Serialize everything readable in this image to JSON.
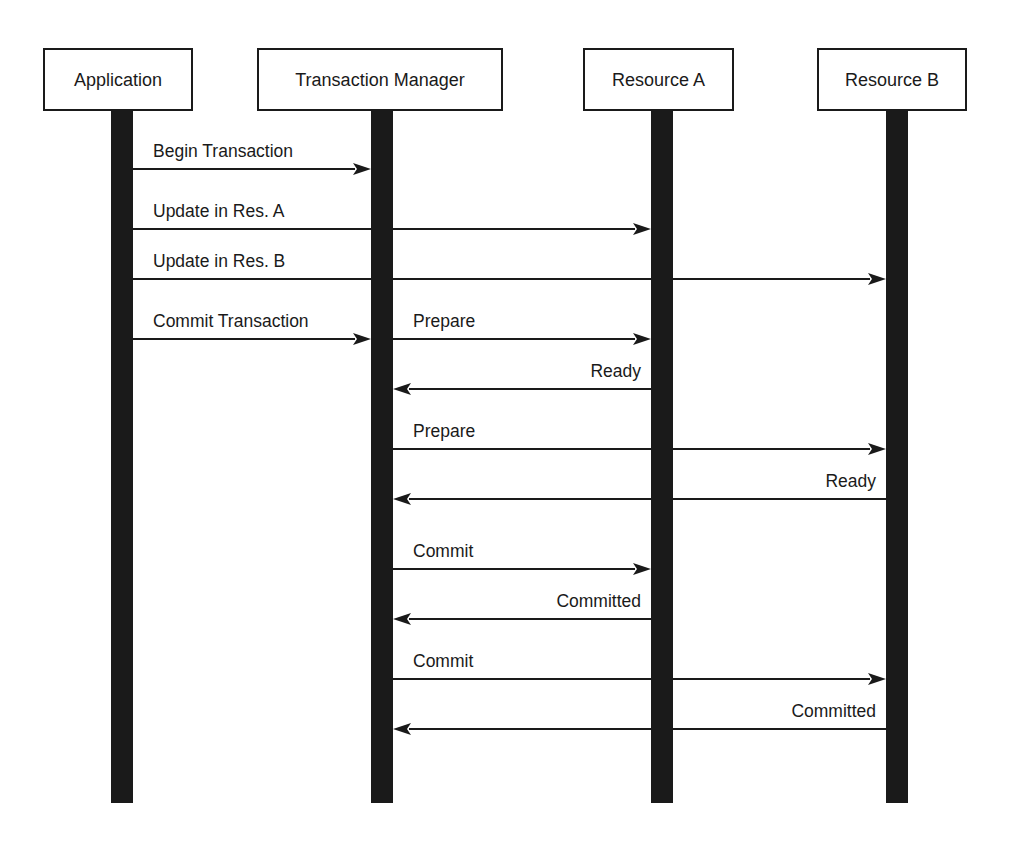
{
  "diagram": {
    "type": "sequence-diagram",
    "width": 1014,
    "height": 848,
    "colors": {
      "ink": "#1a1a1a",
      "background": "#ffffff"
    },
    "lifeline_top": 110,
    "lifeline_bottom": 803,
    "lifeline_width": 22,
    "actors": [
      {
        "id": "application",
        "label": "Application",
        "box": {
          "x": 44,
          "y": 49,
          "w": 148,
          "h": 61
        },
        "lifeline_x": 111
      },
      {
        "id": "transaction-manager",
        "label": "Transaction Manager",
        "box": {
          "x": 258,
          "y": 49,
          "w": 244,
          "h": 61
        },
        "lifeline_x": 371
      },
      {
        "id": "resource-a",
        "label": "Resource A",
        "box": {
          "x": 584,
          "y": 49,
          "w": 149,
          "h": 61
        },
        "lifeline_x": 651
      },
      {
        "id": "resource-b",
        "label": "Resource B",
        "box": {
          "x": 818,
          "y": 49,
          "w": 148,
          "h": 61
        },
        "lifeline_x": 886
      }
    ],
    "messages": [
      {
        "label": "Begin Transaction",
        "from": "application",
        "to": "transaction-manager",
        "y": 169
      },
      {
        "label": "Update in Res. A",
        "from": "application",
        "to": "resource-a",
        "y": 229
      },
      {
        "label": "Update in Res. B",
        "from": "application",
        "to": "resource-b",
        "y": 279
      },
      {
        "label": "Commit Transaction",
        "from": "application",
        "to": "transaction-manager",
        "y": 339
      },
      {
        "label": "Prepare",
        "from": "transaction-manager",
        "to": "resource-a",
        "y": 339
      },
      {
        "label": "Ready",
        "from": "resource-a",
        "to": "transaction-manager",
        "y": 389
      },
      {
        "label": "Prepare",
        "from": "transaction-manager",
        "to": "resource-b",
        "y": 449
      },
      {
        "label": "Ready",
        "from": "resource-b",
        "to": "transaction-manager",
        "y": 499
      },
      {
        "label": "Commit",
        "from": "transaction-manager",
        "to": "resource-a",
        "y": 569
      },
      {
        "label": "Committed",
        "from": "resource-a",
        "to": "transaction-manager",
        "y": 619
      },
      {
        "label": "Commit",
        "from": "transaction-manager",
        "to": "resource-b",
        "y": 679
      },
      {
        "label": "Committed",
        "from": "resource-b",
        "to": "transaction-manager",
        "y": 729
      }
    ]
  }
}
